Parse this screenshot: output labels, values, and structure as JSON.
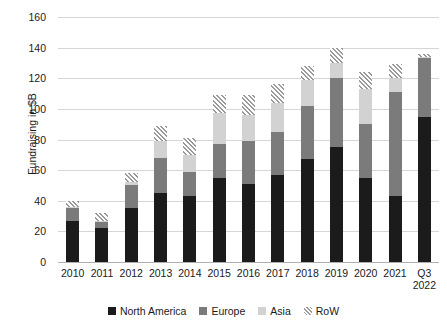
{
  "chart_data": {
    "type": "bar",
    "stacked": true,
    "title": "",
    "xlabel": "",
    "ylabel": "Fundraising in $B",
    "ylim": [
      0,
      160
    ],
    "ytick_step": 20,
    "yticks": [
      0,
      20,
      40,
      60,
      80,
      100,
      120,
      140,
      160
    ],
    "grid": true,
    "legend_position": "bottom",
    "categories": [
      "2010",
      "2011",
      "2012",
      "2013",
      "2014",
      "2015",
      "2016",
      "2017",
      "2018",
      "2019",
      "2020",
      "2021",
      "Q3 2022"
    ],
    "category_lines": [
      [
        "2010"
      ],
      [
        "2011"
      ],
      [
        "2012"
      ],
      [
        "2013"
      ],
      [
        "2014"
      ],
      [
        "2015"
      ],
      [
        "2016"
      ],
      [
        "2017"
      ],
      [
        "2018"
      ],
      [
        "2019"
      ],
      [
        "2020"
      ],
      [
        "2021"
      ],
      [
        "Q3",
        "2022"
      ]
    ],
    "series": [
      {
        "name": "North America",
        "color": "#1b1b1b",
        "values": [
          27,
          22,
          35,
          45,
          43,
          55,
          51,
          57,
          67,
          75,
          55,
          43,
          95
        ]
      },
      {
        "name": "Europe",
        "color": "#7b7b7b",
        "values": [
          8,
          4,
          15,
          23,
          16,
          22,
          28,
          28,
          35,
          45,
          35,
          68,
          38
        ]
      },
      {
        "name": "Asia",
        "color": "#d2d2d2",
        "values": [
          1,
          1,
          2,
          11,
          11,
          20,
          17,
          19,
          17,
          10,
          23,
          9,
          1
        ]
      },
      {
        "name": "RoW",
        "color": "#9a9a9a",
        "pattern": "diagonal-hatch",
        "values": [
          4,
          5,
          6,
          10,
          11,
          12,
          13,
          12,
          9,
          10,
          11,
          9,
          2
        ]
      }
    ],
    "totals": [
      40,
      32,
      58,
      89,
      81,
      109,
      109,
      116,
      128,
      140,
      124,
      129,
      136
    ]
  },
  "legend": {
    "items": [
      {
        "label": "North America",
        "swatch": "solid-black-swatch"
      },
      {
        "label": "Europe",
        "swatch": "solid-dark-gray-swatch"
      },
      {
        "label": "Asia",
        "swatch": "solid-light-gray-swatch"
      },
      {
        "label": "RoW",
        "swatch": "hatched-swatch"
      }
    ]
  }
}
